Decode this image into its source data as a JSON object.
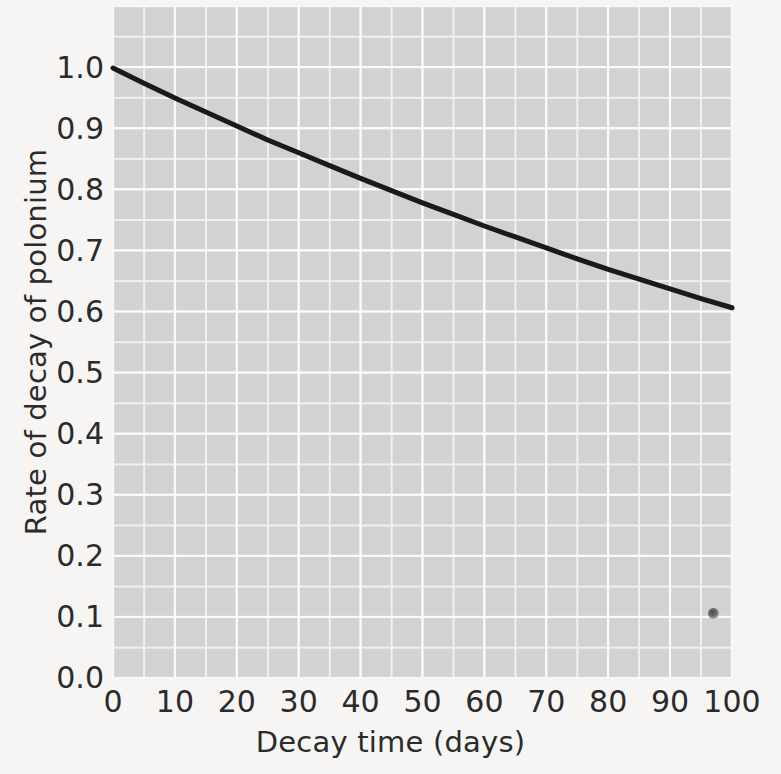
{
  "chart_data": {
    "type": "line",
    "title": "",
    "xlabel": "Decay time (days)",
    "ylabel": "Rate of decay of polonium",
    "xlim": [
      0,
      100
    ],
    "ylim": [
      0.0,
      1.0
    ],
    "xticks": [
      0,
      10,
      20,
      30,
      40,
      50,
      60,
      70,
      80,
      90,
      100
    ],
    "xtick_labels": [
      "0",
      "10",
      "20",
      "30",
      "40",
      "50",
      "60",
      "70",
      "80",
      "90",
      "100"
    ],
    "yticks": [
      0.0,
      0.1,
      0.2,
      0.3,
      0.4,
      0.5,
      0.6,
      0.7,
      0.8,
      0.9,
      1.0
    ],
    "ytick_labels": [
      "0.0",
      "0.1",
      "0.2",
      "0.3",
      "0.4",
      "0.5",
      "0.6",
      "0.7",
      "0.8",
      "0.9",
      "1.0"
    ],
    "grid": true,
    "grid_color": "#fbfbfb",
    "minor_grid": true,
    "minor_grid_color": "#f0f0f0",
    "plot_background": "#d2d2d2",
    "figure_background": "#f6f5f3",
    "legend": null,
    "series": [
      {
        "name": "Rate of decay of polonium",
        "color": "#1a1a1a",
        "linewidth": 5,
        "x": [
          0,
          5,
          10,
          15,
          20,
          25,
          30,
          35,
          40,
          45,
          50,
          55,
          60,
          65,
          70,
          75,
          80,
          85,
          90,
          95,
          100
        ],
        "y": [
          1.0,
          0.975,
          0.951,
          0.928,
          0.905,
          0.882,
          0.861,
          0.84,
          0.819,
          0.799,
          0.779,
          0.76,
          0.741,
          0.723,
          0.705,
          0.687,
          0.67,
          0.654,
          0.638,
          0.622,
          0.607
        ]
      }
    ],
    "annotations": [
      {
        "name": "scan-speck",
        "x": 97,
        "y": 0.105,
        "note": "small dark scan blemish"
      }
    ]
  }
}
